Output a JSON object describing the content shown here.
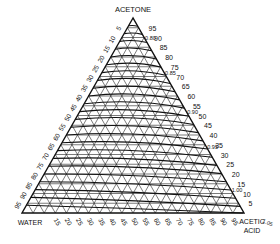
{
  "diagram": {
    "type": "ternary",
    "vertices": {
      "top": "ACETONE",
      "left": "WATER",
      "right_line1": "ACETIC",
      "right_line2": "ACID"
    },
    "right_edge_ticks": [
      "95",
      "90",
      "85",
      "80",
      "75",
      "70",
      "65",
      "60",
      "55",
      "50",
      "45",
      "40",
      "35",
      "30",
      "25",
      "20",
      "15",
      "10",
      "5"
    ],
    "left_edge_ticks": [
      "5",
      "10",
      "15",
      "20",
      "25",
      "30",
      "35",
      "40",
      "45",
      "50",
      "55",
      "60",
      "65",
      "70",
      "75",
      "80",
      "85",
      "90",
      "95"
    ],
    "bottom_edge_ticks": [
      "5",
      "10",
      "15",
      "20",
      "25",
      "30",
      "35",
      "40",
      "45",
      "50",
      "55",
      "60",
      "65",
      "70",
      "75",
      "80",
      "85",
      "90",
      "95"
    ],
    "density_labels": [
      "0.80",
      "0.85",
      "0.90",
      "0.95",
      "1.00",
      "1.05"
    ],
    "grid_step_percent": 5,
    "colors": {
      "line": "#111111",
      "background": "#ffffff"
    }
  }
}
